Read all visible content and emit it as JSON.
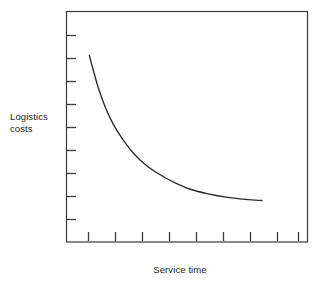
{
  "figure": {
    "y_axis_title": "Logistics\ncosts",
    "x_axis_title": "Service time",
    "line_color": "#2b2b2b",
    "axis_color": "#3a3a3a",
    "background_color": "#ffffff"
  },
  "chart_data": {
    "type": "line",
    "title": "",
    "subtitle": "",
    "xlabel": "Service time",
    "ylabel": "Logistics costs",
    "xlim": [
      0,
      9
    ],
    "ylim": [
      0,
      10
    ],
    "grid": false,
    "legend": null,
    "axis_ticks": {
      "x_tick_count": 9,
      "y_tick_count": 9,
      "x_tick_labels": [],
      "y_tick_labels": [],
      "tick_direction": "inward"
    },
    "annotations": [],
    "series": [
      {
        "name": "Logistics costs",
        "description": "Monotonically decreasing convex curve that falls steeply at low service time then flattens toward an asymptote",
        "x": [
          0.85,
          1.0,
          1.2,
          1.45,
          1.75,
          2.1,
          2.5,
          2.95,
          3.45,
          4.0,
          4.6,
          5.25,
          5.95,
          6.7,
          7.3
        ],
        "y": [
          8.1,
          7.45,
          6.65,
          5.85,
          5.1,
          4.45,
          3.85,
          3.35,
          2.95,
          2.6,
          2.3,
          2.1,
          1.95,
          1.85,
          1.8
        ]
      }
    ]
  }
}
